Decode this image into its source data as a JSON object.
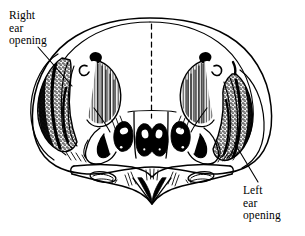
{
  "figure": {
    "type": "scientific-line-illustration",
    "view": "anterior view showing asymmetric ear openings",
    "background_color": "#ffffff",
    "ink_color": "#000000",
    "has_midline": true,
    "midline_style": "dashed vertical"
  },
  "labels": {
    "right_ear": {
      "line1": "Right",
      "line2": "ear",
      "line3": "opening",
      "full_text": "Right ear opening",
      "position": "upper-left"
    },
    "left_ear": {
      "line1": "Left",
      "line2": "ear",
      "line3": "opening",
      "full_text": "Left ear opening",
      "position": "lower-right"
    }
  },
  "annotations": {
    "leader_lines": [
      {
        "name": "right-ear-leader",
        "from_label": "Right ear opening",
        "points_to": "right ear opening (viewer left side of skull)"
      },
      {
        "name": "left-ear-leader",
        "from_label": "Left ear opening",
        "points_to": "left ear opening (viewer right side of skull)"
      }
    ]
  }
}
